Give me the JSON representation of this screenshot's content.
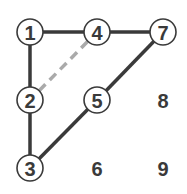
{
  "diagram": {
    "type": "grid-graph",
    "nodes": [
      {
        "id": "1",
        "label": "1",
        "x": 30,
        "y": 32,
        "circled": true
      },
      {
        "id": "4",
        "label": "4",
        "x": 97,
        "y": 32,
        "circled": true
      },
      {
        "id": "7",
        "label": "7",
        "x": 163,
        "y": 32,
        "circled": true
      },
      {
        "id": "2",
        "label": "2",
        "x": 30,
        "y": 100,
        "circled": true
      },
      {
        "id": "5",
        "label": "5",
        "x": 97,
        "y": 100,
        "circled": true
      },
      {
        "id": "8",
        "label": "8",
        "x": 163,
        "y": 100,
        "circled": false
      },
      {
        "id": "3",
        "label": "3",
        "x": 30,
        "y": 168,
        "circled": true
      },
      {
        "id": "6",
        "label": "6",
        "x": 97,
        "y": 168,
        "circled": false
      },
      {
        "id": "9",
        "label": "9",
        "x": 163,
        "y": 168,
        "circled": false
      }
    ],
    "edges": [
      {
        "from": "1",
        "to": "4",
        "style": "solid"
      },
      {
        "from": "4",
        "to": "7",
        "style": "solid"
      },
      {
        "from": "1",
        "to": "2",
        "style": "solid"
      },
      {
        "from": "2",
        "to": "3",
        "style": "solid"
      },
      {
        "from": "3",
        "to": "5",
        "style": "solid"
      },
      {
        "from": "5",
        "to": "7",
        "style": "solid"
      },
      {
        "from": "2",
        "to": "4",
        "style": "dashed"
      }
    ],
    "colors": {
      "solid_edge": "#3a3a3a",
      "dashed_edge": "#aaaaaa",
      "node_stroke": "#3a3a3a",
      "label": "#3a3a3a"
    }
  }
}
